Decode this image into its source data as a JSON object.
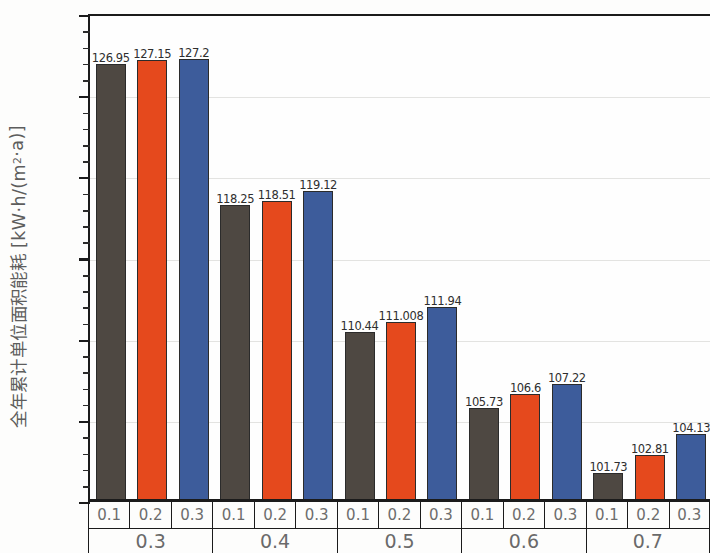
{
  "chart_data": {
    "type": "bar",
    "title": "",
    "subtitle": "",
    "xlabel": "",
    "ylabel": "全年累计单位面积能耗 [kW·h/(m²·a)]",
    "ylim": [
      100,
      130
    ],
    "ytick_labels": [
      "100",
      "105",
      "110",
      "115",
      "120",
      "125",
      "130"
    ],
    "ytick_values": [
      100,
      105,
      110,
      115,
      120,
      125,
      130
    ],
    "ytick_minor_step": 1,
    "grid": true,
    "grid_axis": "y",
    "legend": null,
    "legend_position": "none",
    "categories": [
      "0.3",
      "0.4",
      "0.5",
      "0.6",
      "0.7"
    ],
    "subcategories": [
      "0.1",
      "0.2",
      "0.3"
    ],
    "series": [
      {
        "name": "0.1",
        "color": "#4e4842",
        "values": [
          126.95,
          118.25,
          110.44,
          105.73,
          101.73
        ],
        "labels": [
          "126.95",
          "118.25",
          "110.44",
          "105.73",
          "101.73"
        ]
      },
      {
        "name": "0.2",
        "color": "#e5491d",
        "values": [
          127.15,
          118.51,
          111.008,
          106.6,
          102.81
        ],
        "labels": [
          "127.15",
          "118.51",
          "111.008",
          "106.6",
          "102.81"
        ]
      },
      {
        "name": "0.3",
        "color": "#3d5c9b",
        "values": [
          127.2,
          119.12,
          111.94,
          107.22,
          104.13
        ],
        "labels": [
          "127.2",
          "119.12",
          "111.94",
          "107.22",
          "104.13"
        ]
      }
    ]
  },
  "axis": {
    "y_title": "全年累计单位面积能耗 [kW·h/(m²·a)]",
    "y_unit_numerator": "kW·h",
    "y_unit_denominator": "m²·a"
  }
}
